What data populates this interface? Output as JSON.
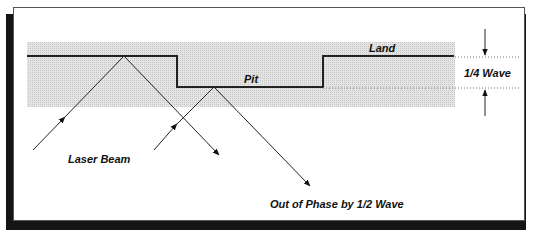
{
  "diagram": {
    "labels": {
      "land": "Land",
      "pit": "Pit",
      "quarter_wave": "1/4 Wave",
      "laser_beam": "Laser Beam",
      "out_of_phase": "Out of Phase by 1/2 Wave"
    },
    "colors": {
      "surface_fill": "#d9d9d9",
      "line": "#222222",
      "frame_shadow": "#151515"
    }
  }
}
